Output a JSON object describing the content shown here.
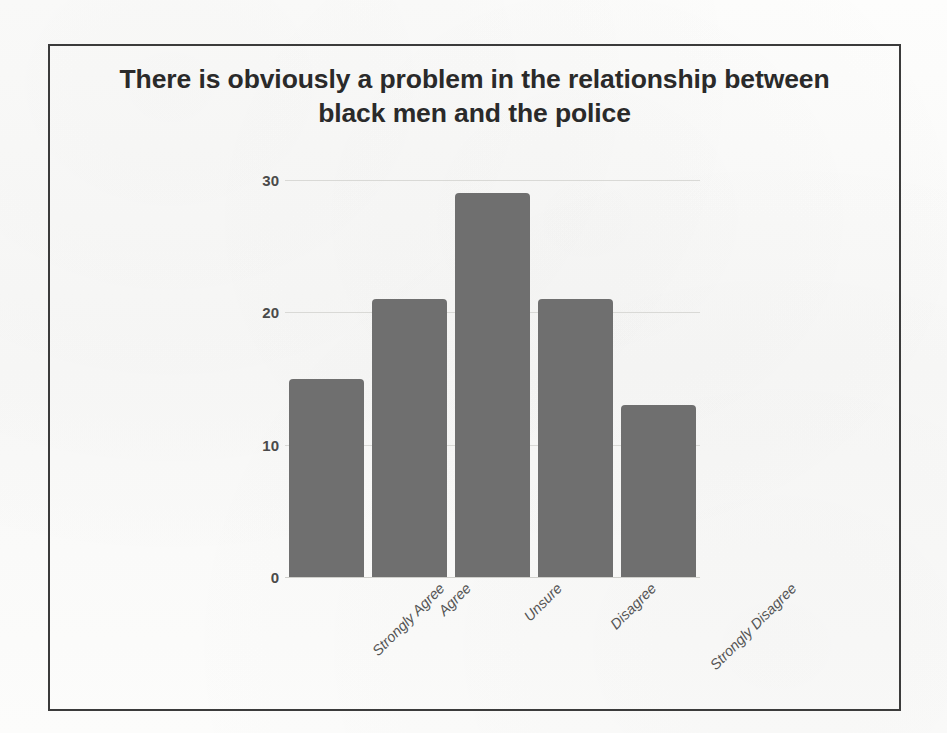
{
  "slide": {
    "title": "There is obviously a problem in the relationship between black men and the police"
  },
  "colors": {
    "bar_fill": "#6f6f6f",
    "gridline": "#d9d9d6",
    "title_text": "#2a2a2a",
    "tick_text": "#4a4a4a",
    "frame_border": "#3b3b3b",
    "page_background": "#fbfbfa"
  },
  "chart_data": {
    "type": "bar",
    "title": "There is obviously a problem in the relationship between black men and the police",
    "xlabel": "",
    "ylabel": "",
    "categories": [
      "Strongly Agree",
      "Agree",
      "Unsure",
      "Disagree",
      "Strongly Disagree"
    ],
    "values": [
      15,
      21,
      29,
      21,
      13
    ],
    "ylim": [
      0,
      30
    ],
    "yticks": [
      0,
      10,
      20,
      30
    ],
    "ytick_labels": [
      "0",
      "10",
      "20",
      "30"
    ],
    "grid": true,
    "grid_axis": "y",
    "legend": false,
    "legend_position": "none",
    "bar_label_rotation": -45,
    "series": [
      {
        "name": "Responses",
        "values": [
          15,
          21,
          29,
          21,
          13
        ]
      }
    ]
  }
}
